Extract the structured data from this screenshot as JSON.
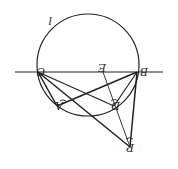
{
  "diagram": {
    "type": "geometry",
    "orientation": "rotated-180",
    "stroke_color": "#222222",
    "background": "#ffffff",
    "circle": {
      "label": "l",
      "cx": 88,
      "cy": 65,
      "r": 51
    },
    "baseline": {
      "x1": 15,
      "y1": 72,
      "x2": 163,
      "y2": 72
    },
    "points": {
      "C": {
        "label": "C",
        "x": 38,
        "y": 72
      },
      "B": {
        "label": "B",
        "x": 137,
        "y": 72
      },
      "E": {
        "label": "E",
        "x": 103,
        "y": 72
      },
      "A": {
        "label": "A",
        "x": 57,
        "y": 106
      },
      "D": {
        "label": "D",
        "x": 114,
        "y": 106
      },
      "P": {
        "label": "P",
        "x": 130,
        "y": 147
      }
    },
    "segments": [
      "C-D",
      "C-P",
      "C-A",
      "B-A",
      "B-D",
      "B-P",
      "E-P"
    ],
    "angle_marks": [
      "A",
      "D",
      "P"
    ]
  }
}
